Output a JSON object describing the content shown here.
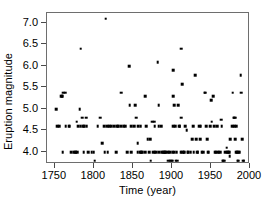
{
  "chart_data": {
    "type": "scatter",
    "title": "",
    "xlabel": "Time (year)",
    "ylabel": "Eruption magnitude",
    "xlim": [
      1740,
      2000
    ],
    "ylim": [
      3.72,
      7.23
    ],
    "xticks": [
      1750,
      1800,
      1850,
      1900,
      1950,
      2000
    ],
    "xticklabels": [
      "1750",
      "1800",
      "1850",
      "1900",
      "1950",
      "2000"
    ],
    "yticks": [
      4.0,
      4.5,
      5.0,
      5.5,
      6.0,
      6.5,
      7.0
    ],
    "yticklabels": [
      "4.0",
      "4.5",
      "5.0",
      "5.5",
      "6.0",
      "6.5",
      "7.0"
    ],
    "grid": false,
    "legend": null,
    "marker": "square",
    "marker_color": "#000000",
    "frame_color": "#6e6e6e",
    "points": [
      [
        1752,
        5.0
      ],
      [
        1753,
        4.6
      ],
      [
        1756,
        4.6
      ],
      [
        1758,
        5.3
      ],
      [
        1759,
        5.3
      ],
      [
        1760,
        5.3
      ],
      [
        1761,
        5.38
      ],
      [
        1763,
        5.38
      ],
      [
        1760,
        4.0
      ],
      [
        1764,
        4.6
      ],
      [
        1768,
        4.6
      ],
      [
        1771,
        4.0
      ],
      [
        1774,
        4.0
      ],
      [
        1776,
        4.0
      ],
      [
        1777,
        4.0
      ],
      [
        1779,
        4.0
      ],
      [
        1778,
        4.7
      ],
      [
        1780,
        4.6
      ],
      [
        1782,
        5.0
      ],
      [
        1783,
        6.4
      ],
      [
        1783,
        4.6
      ],
      [
        1785,
        4.8
      ],
      [
        1786,
        4.6
      ],
      [
        1788,
        4.6
      ],
      [
        1790,
        4.8
      ],
      [
        1791,
        4.6
      ],
      [
        1793,
        4.0
      ],
      [
        1797,
        4.0
      ],
      [
        1800,
        4.0
      ],
      [
        1801,
        3.8
      ],
      [
        1808,
        4.8
      ],
      [
        1811,
        4.2
      ],
      [
        1813,
        4.6
      ],
      [
        1815,
        7.1
      ],
      [
        1814,
        4.0
      ],
      [
        1817,
        4.6
      ],
      [
        1818,
        4.0
      ],
      [
        1822,
        4.6
      ],
      [
        1826,
        4.6
      ],
      [
        1830,
        4.6
      ],
      [
        1831,
        4.6
      ],
      [
        1835,
        5.38
      ],
      [
        1835,
        4.6
      ],
      [
        1840,
        4.6
      ],
      [
        1843,
        4.0
      ],
      [
        1845,
        6.0
      ],
      [
        1846,
        5.08
      ],
      [
        1848,
        4.6
      ],
      [
        1852,
        4.6
      ],
      [
        1853,
        5.08
      ],
      [
        1854,
        4.8
      ],
      [
        1856,
        4.2
      ],
      [
        1856,
        4.0
      ],
      [
        1859,
        4.0
      ],
      [
        1861,
        4.0
      ],
      [
        1862,
        4.0
      ],
      [
        1866,
        5.3
      ],
      [
        1867,
        4.6
      ],
      [
        1869,
        4.3
      ],
      [
        1871,
        4.0
      ],
      [
        1872,
        4.3
      ],
      [
        1873,
        3.8
      ],
      [
        1875,
        4.7
      ],
      [
        1877,
        4.7
      ],
      [
        1878,
        4.0
      ],
      [
        1880,
        4.0
      ],
      [
        1882,
        6.08
      ],
      [
        1883,
        5.08
      ],
      [
        1883,
        4.6
      ],
      [
        1884,
        4.0
      ],
      [
        1886,
        4.6
      ],
      [
        1887,
        4.0
      ],
      [
        1889,
        4.0
      ],
      [
        1890,
        4.0
      ],
      [
        1891,
        4.0
      ],
      [
        1892,
        4.0
      ],
      [
        1895,
        3.8
      ],
      [
        1897,
        3.8
      ],
      [
        1899,
        3.8
      ],
      [
        1900,
        3.8
      ],
      [
        1902,
        5.9
      ],
      [
        1902,
        5.3
      ],
      [
        1903,
        5.08
      ],
      [
        1902,
        4.6
      ],
      [
        1904,
        4.6
      ],
      [
        1901,
        4.0
      ],
      [
        1903,
        4.0
      ],
      [
        1905,
        3.8
      ],
      [
        1907,
        3.8
      ],
      [
        1908,
        5.08
      ],
      [
        1909,
        4.6
      ],
      [
        1910,
        4.6
      ],
      [
        1912,
        6.4
      ],
      [
        1913,
        5.58
      ],
      [
        1912,
        4.8
      ],
      [
        1913,
        4.0
      ],
      [
        1911,
        4.0
      ],
      [
        1915,
        4.0
      ],
      [
        1917,
        4.6
      ],
      [
        1919,
        4.5
      ],
      [
        1920,
        4.0
      ],
      [
        1921,
        4.0
      ],
      [
        1924,
        4.0
      ],
      [
        1926,
        4.3
      ],
      [
        1928,
        4.0
      ],
      [
        1930,
        5.78
      ],
      [
        1931,
        4.3
      ],
      [
        1932,
        4.0
      ],
      [
        1933,
        4.0
      ],
      [
        1936,
        4.3
      ],
      [
        1938,
        4.0
      ],
      [
        1940,
        4.0
      ],
      [
        1942,
        5.38
      ],
      [
        1943,
        5.38
      ],
      [
        1944,
        4.6
      ],
      [
        1945,
        4.3
      ],
      [
        1946,
        4.0
      ],
      [
        1947,
        4.0
      ],
      [
        1950,
        5.2
      ],
      [
        1951,
        4.7
      ],
      [
        1953,
        5.3
      ],
      [
        1954,
        4.6
      ],
      [
        1955,
        4.0
      ],
      [
        1956,
        4.0
      ],
      [
        1958,
        4.0
      ],
      [
        1960,
        4.0
      ],
      [
        1962,
        4.0
      ],
      [
        1963,
        4.75
      ],
      [
        1964,
        4.6
      ],
      [
        1965,
        3.8
      ],
      [
        1966,
        3.8
      ],
      [
        1967,
        3.8
      ],
      [
        1968,
        4.0
      ],
      [
        1970,
        4.1
      ],
      [
        1972,
        4.0
      ],
      [
        1974,
        3.9
      ],
      [
        1975,
        4.3
      ],
      [
        1977,
        4.6
      ],
      [
        1978,
        5.38
      ],
      [
        1979,
        4.8
      ],
      [
        1980,
        4.8
      ],
      [
        1981,
        4.8
      ],
      [
        1980,
        4.6
      ],
      [
        1982,
        4.6
      ],
      [
        1981,
        4.3
      ],
      [
        1982,
        4.0
      ],
      [
        1983,
        4.0
      ],
      [
        1984,
        3.8
      ],
      [
        1985,
        3.8
      ],
      [
        1988,
        5.78
      ],
      [
        1989,
        5.38
      ],
      [
        1990,
        4.3
      ],
      [
        1991,
        3.8
      ],
      [
        1992,
        3.8
      ],
      [
        1878,
        4.6
      ],
      [
        1866,
        4.0
      ],
      [
        1860,
        4.6
      ],
      [
        1829,
        4.0
      ],
      [
        1848,
        4.0
      ],
      [
        1894,
        4.0
      ],
      [
        1896,
        4.0
      ],
      [
        1898,
        4.0
      ],
      [
        1927,
        4.6
      ],
      [
        1935,
        4.6
      ],
      [
        1949,
        4.6
      ],
      [
        1971,
        4.0
      ],
      [
        1986,
        4.0
      ],
      [
        1769,
        4.6
      ],
      [
        1787,
        4.0
      ],
      [
        1805,
        4.6
      ],
      [
        1820,
        4.6
      ],
      [
        1838,
        4.6
      ],
      [
        1857,
        4.6
      ],
      [
        1876,
        4.0
      ],
      [
        1906,
        4.0
      ],
      [
        1916,
        4.0
      ],
      [
        1937,
        4.6
      ],
      [
        1958,
        4.6
      ],
      [
        1973,
        4.0
      ],
      [
        1985,
        4.0
      ]
    ]
  }
}
